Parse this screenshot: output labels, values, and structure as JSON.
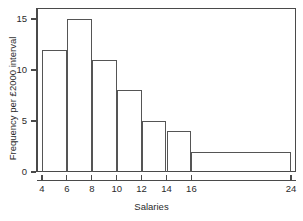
{
  "chart_data": {
    "type": "bar",
    "title": "",
    "subtitle": "",
    "xlabel": "Salaries",
    "ylabel": "Frequency per £2000 interval",
    "grid": false,
    "legend": null,
    "xlim": [
      4,
      24
    ],
    "ylim": [
      0,
      15
    ],
    "x_ticks": [
      "4",
      "6",
      "8",
      "10",
      "12",
      "14",
      "16",
      "24"
    ],
    "x_tick_values": [
      4,
      6,
      8,
      10,
      12,
      14,
      16,
      24
    ],
    "y_ticks": [
      "0",
      "5",
      "10",
      "15"
    ],
    "y_tick_values": [
      0,
      5,
      10,
      15
    ],
    "categories": [
      "4-6",
      "6-8",
      "8-10",
      "10-12",
      "12-14",
      "14-16",
      "16-24"
    ],
    "bin_edges": [
      4,
      6,
      8,
      10,
      12,
      14,
      16,
      24
    ],
    "values": [
      12,
      15,
      11,
      8,
      5,
      4,
      2
    ],
    "bars": [
      {
        "label": "4-6",
        "x0": 4,
        "x1": 6,
        "height": 12
      },
      {
        "label": "6-8",
        "x0": 6,
        "x1": 8,
        "height": 15
      },
      {
        "label": "8-10",
        "x0": 8,
        "x1": 10,
        "height": 11
      },
      {
        "label": "10-12",
        "x0": 10,
        "x1": 12,
        "height": 8
      },
      {
        "label": "12-14",
        "x0": 12,
        "x1": 14,
        "height": 5
      },
      {
        "label": "14-16",
        "x0": 14,
        "x1": 16,
        "height": 4
      },
      {
        "label": "16-24",
        "x0": 16,
        "x1": 24,
        "height": 2
      }
    ],
    "colors": {
      "bar_fill": "transparent",
      "bar_stroke": "#555555",
      "axis": "#4a4a4a",
      "text": "#2b2b2b",
      "background": "#ffffff"
    }
  }
}
